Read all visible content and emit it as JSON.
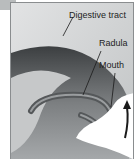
{
  "diagram": {
    "labels": {
      "digestive_tract": "Digestive tract",
      "radula": "Radula",
      "mouth": "Mouth"
    },
    "colors": {
      "background": "#d4d6d7",
      "tissue_dark": "#4a4d4f",
      "tissue_mid": "#8a8d8f",
      "food_surface": "#ffffff",
      "arrow": "#1a1a1a"
    },
    "arrow_direction": "up"
  }
}
